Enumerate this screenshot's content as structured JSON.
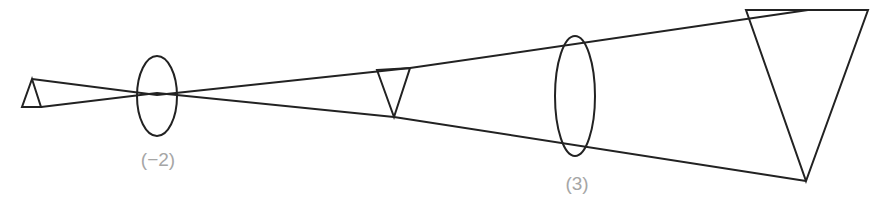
{
  "diagram": {
    "title": "",
    "colors": {
      "line": "#222222",
      "label": "#a6a6a6",
      "background": "#ffffff"
    },
    "lenses": [
      {
        "id": "lens-1",
        "label": "(−2)"
      },
      {
        "id": "lens-2",
        "label": "(3)"
      }
    ],
    "objects": [
      {
        "id": "object",
        "kind": "upright-triangle"
      },
      {
        "id": "intermediate-image",
        "kind": "inverted-triangle"
      },
      {
        "id": "final-image",
        "kind": "inverted-triangle"
      }
    ]
  }
}
